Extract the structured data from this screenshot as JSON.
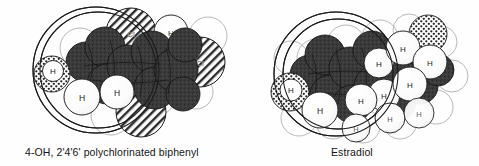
{
  "figure": {
    "type": "molecular-space-filling-comparison",
    "background_color": "#fefefe",
    "line_color": "#1a1a1a"
  },
  "panels": [
    {
      "id": "pcb",
      "caption": "4-OH, 2'4'6' polychlorinated biphenyl",
      "atom_labels": [
        "H",
        "H",
        "H",
        "Cl",
        "Cl",
        "Cl",
        "H"
      ],
      "overlay_circles": 2
    },
    {
      "id": "estradiol",
      "caption": "Estradiol",
      "atom_labels": [
        "H",
        "H",
        "H",
        "H",
        "H",
        "H",
        "H",
        "H",
        "H",
        "H"
      ],
      "overlay_circles": 2
    }
  ],
  "legend": {
    "carbon_fill": "#3a3a3a",
    "hydrogen_fill": "#ffffff",
    "chlorine_pattern": "diagonal-hatch",
    "oxygen_pattern": "stipple-dots"
  },
  "captions": {
    "left": "4-OH, 2'4'6' polychlorinated biphenyl",
    "right": "Estradiol"
  },
  "atoms": {
    "pcb": [
      {
        "label": "H",
        "kind": "oxygen-h",
        "cx": 52,
        "cy": 74,
        "r": 18
      },
      {
        "label": "H",
        "kind": "hydrogen",
        "cx": 82,
        "cy": 97,
        "r": 18
      },
      {
        "label": "H",
        "kind": "hydrogen",
        "cx": 117,
        "cy": 92,
        "r": 17
      },
      {
        "label": "Cl",
        "kind": "chlorine",
        "cx": 131,
        "cy": 33,
        "r": 25
      },
      {
        "label": "Cl",
        "kind": "chlorine",
        "cx": 141,
        "cy": 112,
        "r": 25
      },
      {
        "label": "Cl",
        "kind": "chlorine",
        "cx": 200,
        "cy": 62,
        "r": 25
      },
      {
        "label": "H",
        "kind": "hydrogen",
        "cx": 171,
        "cy": 32,
        "r": 17
      }
    ],
    "estradiol": [
      {
        "label": "H",
        "kind": "oxygen-h",
        "cx": 290,
        "cy": 92,
        "r": 18
      },
      {
        "label": "H",
        "kind": "hydrogen",
        "cx": 320,
        "cy": 110,
        "r": 18
      },
      {
        "label": "H",
        "kind": "hydrogen",
        "cx": 361,
        "cy": 100,
        "r": 16
      },
      {
        "label": "H",
        "kind": "hydrogen",
        "cx": 379,
        "cy": 63,
        "r": 15
      },
      {
        "label": "H",
        "kind": "hydrogen",
        "cx": 384,
        "cy": 95,
        "r": 16
      },
      {
        "label": "H",
        "kind": "hydrogen",
        "cx": 403,
        "cy": 48,
        "r": 17
      },
      {
        "label": "H",
        "kind": "hydrogen",
        "cx": 410,
        "cy": 84,
        "r": 17
      },
      {
        "label": "H",
        "kind": "hydrogen",
        "cx": 430,
        "cy": 62,
        "r": 17
      },
      {
        "label": "H",
        "kind": "hydrogen",
        "cx": 419,
        "cy": 113,
        "r": 15
      },
      {
        "label": "H",
        "kind": "hydrogen",
        "cx": 356,
        "cy": 130,
        "r": 14
      }
    ]
  }
}
